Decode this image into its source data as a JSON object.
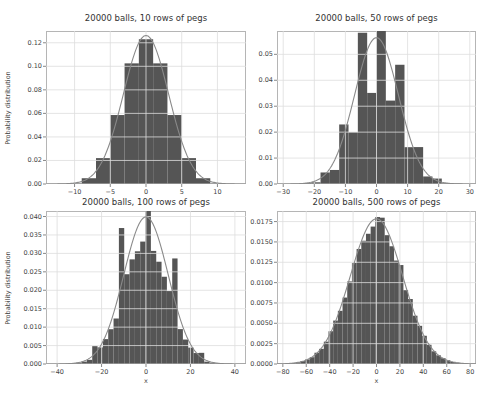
{
  "figure": {
    "background": "#ffffff",
    "bar_color": "#555555",
    "curve_color": "#8a8a8a",
    "grid_color": "#dddddd",
    "frame_color": "#b5b5b5"
  },
  "chart_data": [
    {
      "type": "bar",
      "title": "20000 balls, 10 rows of pegs",
      "xlabel": "",
      "ylabel": "Probability distribution",
      "rows": 10,
      "balls": 20000,
      "xlim": [
        -14,
        14
      ],
      "ylim": [
        0,
        0.13
      ],
      "xticks": [
        -10,
        -5,
        0,
        5,
        10
      ],
      "yticks": [
        0.0,
        0.02,
        0.04,
        0.06,
        0.08,
        0.1,
        0.12
      ],
      "ytick_labels": [
        "0.00",
        "0.02",
        "0.04",
        "0.06",
        "0.08",
        "0.10",
        "0.12"
      ],
      "grid": true,
      "bins": {
        "x": [
          -10,
          -8,
          -6,
          -4,
          -2,
          0,
          2,
          4,
          6,
          8,
          10
        ],
        "width": 2,
        "values": [
          0.0005,
          0.0049,
          0.022,
          0.0586,
          0.1025,
          0.123,
          0.1025,
          0.0586,
          0.022,
          0.0049,
          0.0005
        ]
      },
      "overlay": "normal pdf curve (mean 0, sd 3.16)",
      "sigma": 3.162
    },
    {
      "type": "bar",
      "title": "20000 balls, 50 rows of pegs",
      "xlabel": "",
      "ylabel": "",
      "rows": 50,
      "balls": 20000,
      "xlim": [
        -32,
        32
      ],
      "ylim": [
        0,
        0.059
      ],
      "xticks": [
        -30,
        -20,
        -10,
        0,
        10,
        20,
        30
      ],
      "yticks": [
        0.0,
        0.01,
        0.02,
        0.03,
        0.04,
        0.05
      ],
      "ytick_labels": [
        "0.00",
        "0.01",
        "0.02",
        "0.03",
        "0.04",
        "0.05"
      ],
      "grid": true,
      "overlay": "normal pdf curve (mean 0, sd 7.07)",
      "sigma": 7.071,
      "peak": 0.056
    },
    {
      "type": "bar",
      "title": "20000 balls, 100 rows of pegs",
      "xlabel": "x",
      "ylabel": "Probability distribution",
      "rows": 100,
      "balls": 20000,
      "xlim": [
        -45,
        45
      ],
      "ylim": [
        0,
        0.0415
      ],
      "xticks": [
        -40,
        -20,
        0,
        20,
        40
      ],
      "yticks": [
        0.0,
        0.005,
        0.01,
        0.015,
        0.02,
        0.025,
        0.03,
        0.035,
        0.04
      ],
      "ytick_labels": [
        "0.000",
        "0.005",
        "0.010",
        "0.015",
        "0.020",
        "0.025",
        "0.030",
        "0.035",
        "0.040"
      ],
      "grid": true,
      "overlay": "normal pdf curve (mean 0, sd 10)",
      "sigma": 10.0,
      "peak": 0.0399
    },
    {
      "type": "bar",
      "title": "20000 balls, 500 rows of pegs",
      "xlabel": "x",
      "ylabel": "",
      "rows": 500,
      "balls": 20000,
      "xlim": [
        -85,
        85
      ],
      "ylim": [
        0,
        0.0188
      ],
      "xticks": [
        -80,
        -60,
        -40,
        -20,
        0,
        20,
        40,
        60,
        80
      ],
      "yticks": [
        0.0,
        0.0025,
        0.005,
        0.0075,
        0.01,
        0.0125,
        0.015,
        0.0175
      ],
      "ytick_labels": [
        "0.0000",
        "0.0025",
        "0.0050",
        "0.0075",
        "0.0100",
        "0.0125",
        "0.0150",
        "0.0175"
      ],
      "grid": true,
      "overlay": "normal pdf curve (mean 0, sd 22.36)",
      "sigma": 22.36,
      "peak": 0.0178
    }
  ],
  "layout": [
    {
      "left": 46,
      "top": 31,
      "width": 200,
      "height": 153,
      "title_y": 13
    },
    {
      "left": 277,
      "top": 31,
      "width": 199,
      "height": 153,
      "title_y": 13
    },
    {
      "left": 46,
      "top": 211,
      "width": 200,
      "height": 153,
      "title_y": 197
    },
    {
      "left": 277,
      "top": 211,
      "width": 199,
      "height": 153,
      "title_y": 197
    }
  ]
}
